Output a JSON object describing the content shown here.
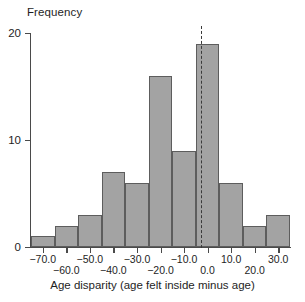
{
  "chart_data": {
    "type": "bar",
    "title": "",
    "subtitle": "",
    "xlabel": "Age disparity (age felt inside minus age)",
    "ylabel": "Frequency",
    "categories": [
      "-75 to -65",
      "-65 to -55",
      "-55 to -45",
      "-45 to -35",
      "-35 to -25",
      "-25 to -15",
      "-15 to -5",
      "-5 to 5",
      "5 to 15",
      "15 to 25",
      "25 to 35"
    ],
    "bin_edges": [
      -75,
      -65,
      -55,
      -45,
      -35,
      -25,
      -15,
      -5,
      5,
      15,
      25,
      35
    ],
    "bin_width": 10,
    "bins": [
      {
        "label": "-75 to -65",
        "start": -75,
        "end": -65,
        "value": 1
      },
      {
        "label": "-65 to -55",
        "start": -65,
        "end": -55,
        "value": 2
      },
      {
        "label": "-55 to -45",
        "start": -55,
        "end": -45,
        "value": 3
      },
      {
        "label": "-45 to -35",
        "start": -45,
        "end": -35,
        "value": 7
      },
      {
        "label": "-35 to -25",
        "start": -35,
        "end": -25,
        "value": 6
      },
      {
        "label": "-25 to -15",
        "start": -25,
        "end": -15,
        "value": 16
      },
      {
        "label": "-15 to -5",
        "start": -15,
        "end": -5,
        "value": 9
      },
      {
        "label": "-5 to 5",
        "start": -5,
        "end": 5,
        "value": 19
      },
      {
        "label": "5 to 15",
        "start": 5,
        "end": 15,
        "value": 6
      },
      {
        "label": "15 to 25",
        "start": 15,
        "end": 25,
        "value": 2
      },
      {
        "label": "25 to 35",
        "start": 25,
        "end": 35,
        "value": 3
      }
    ],
    "values": [
      1,
      2,
      3,
      7,
      6,
      16,
      9,
      19,
      6,
      2,
      3
    ],
    "xlim": [
      -75,
      35
    ],
    "ylim": [
      0,
      20
    ],
    "grid": false,
    "legend": false,
    "bar_color": "#a3a3a3",
    "bar_edge_color": "#5d5d5d",
    "axis_color": "#4a4a4a",
    "x_ticks": [
      {
        "value": -70,
        "label": "−70.0",
        "row": "a"
      },
      {
        "value": -60,
        "label": "−60.0",
        "row": "b"
      },
      {
        "value": -50,
        "label": "−50.0",
        "row": "a"
      },
      {
        "value": -40,
        "label": "−40.0",
        "row": "b"
      },
      {
        "value": -30,
        "label": "−30.0",
        "row": "a"
      },
      {
        "value": -20,
        "label": "−20.0",
        "row": "b"
      },
      {
        "value": -10,
        "label": "−10.0",
        "row": "a"
      },
      {
        "value": 0,
        "label": "0.0",
        "row": "b"
      },
      {
        "value": 10,
        "label": "10.0",
        "row": "a"
      },
      {
        "value": 20,
        "label": "20.0",
        "row": "b"
      },
      {
        "value": 30,
        "label": "30.0",
        "row": "a"
      }
    ],
    "y_ticks": [
      {
        "value": 0,
        "label": "0"
      },
      {
        "value": 10,
        "label": "10"
      },
      {
        "value": 20,
        "label": "20"
      }
    ],
    "annotations": [
      {
        "name": "mean-reference-line",
        "style": "dashed",
        "orientation": "vertical",
        "x_value": -3,
        "color": "#3a3a3a"
      }
    ]
  }
}
